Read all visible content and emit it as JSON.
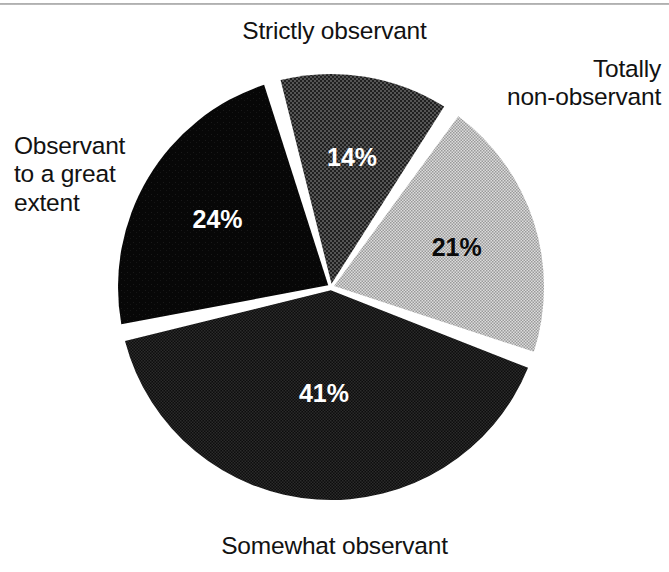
{
  "chart_data": {
    "type": "pie",
    "title": "",
    "categories": [
      "Strictly observant",
      "Totally non-observant",
      "Somewhat observant",
      "Observant to a great extent"
    ],
    "values": [
      14,
      21,
      41,
      24
    ],
    "value_labels": [
      "14%",
      "21%",
      "41%",
      "24%"
    ],
    "units": "percent",
    "legend_position": "none",
    "labels_placement": "outside-callout-free",
    "slices": [
      {
        "name": "Strictly observant",
        "value": 14,
        "value_label": "14%",
        "fill": "#3d3d3d",
        "pattern": "coarse-dither-dark",
        "label_color": "#ffffff",
        "start_angle": -16,
        "end_angle": 34.4
      },
      {
        "name": "Totally non-observant",
        "value": 21,
        "value_label": "21%",
        "fill": "#c2c2c2",
        "pattern": "fine-dither-light",
        "label_color": "#0a0a0a",
        "start_angle": 34.4,
        "end_angle": 110
      },
      {
        "name": "Somewhat observant",
        "value": 41,
        "value_label": "41%",
        "fill": "#161616",
        "pattern": "fine-dither-verydark",
        "label_color": "#ffffff",
        "start_angle": 110,
        "end_angle": 257.6
      },
      {
        "name": "Observant to a great extent",
        "value": 24,
        "value_label": "24%",
        "fill": "#0b0b0b",
        "pattern": "solid-black",
        "label_color": "#ffffff",
        "start_angle": 257.6,
        "end_angle": 344
      }
    ],
    "separator_color": "#ffffff",
    "background": "#ffffff"
  },
  "labels": {
    "strictly_observant": "Strictly observant",
    "totally_non_observant": "Totally\nnon-observant",
    "observant_great_extent": "Observant\nto a great\nextent",
    "somewhat_observant": "Somewhat observant"
  }
}
